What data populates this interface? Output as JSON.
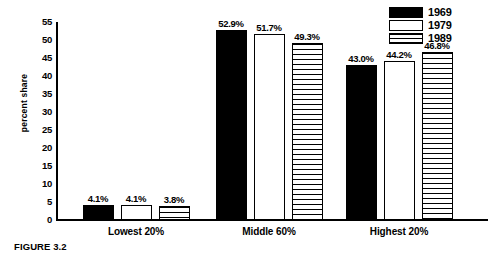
{
  "figure": {
    "caption": "FIGURE 3.2"
  },
  "chart_data": {
    "type": "bar",
    "title": "",
    "xlabel": "",
    "ylabel": "percent share",
    "ylim": [
      0,
      55
    ],
    "yticks": [
      0,
      5,
      10,
      15,
      20,
      25,
      30,
      35,
      40,
      45,
      50,
      55
    ],
    "ytick_labels": [
      "0",
      "5",
      "10",
      "15",
      "20",
      "25",
      "30",
      "35",
      "40",
      "45",
      "50",
      "55"
    ],
    "grid": false,
    "legend_position": "top-right",
    "categories": [
      "Lowest 20%",
      "Middle 60%",
      "Highest 20%"
    ],
    "series": [
      {
        "name": "1969",
        "fill": "solid-black",
        "color": "#000000",
        "values": [
          4.1,
          52.9,
          43.0
        ],
        "labels": [
          "4.1%",
          "52.9%",
          "43.0%"
        ]
      },
      {
        "name": "1979",
        "fill": "open-white",
        "color": "#ffffff",
        "values": [
          4.1,
          51.7,
          44.2
        ],
        "labels": [
          "4.1%",
          "51.7%",
          "44.2%"
        ]
      },
      {
        "name": "1989",
        "fill": "horizontal-hatch",
        "color": "#ffffff",
        "values": [
          3.8,
          49.3,
          46.8
        ],
        "labels": [
          "3.8%",
          "49.3%",
          "46.8%"
        ]
      }
    ]
  }
}
